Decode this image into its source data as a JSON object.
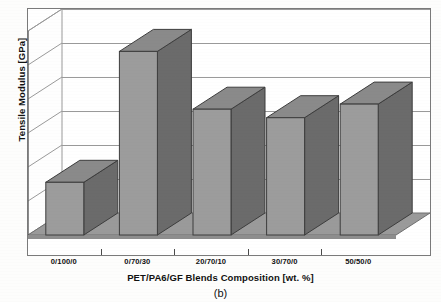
{
  "chart_data": {
    "type": "bar",
    "title": "",
    "caption": "(b)",
    "xlabel": "PET/PA6/GF Blends Composition [wt. %]",
    "ylabel": "Tensile Modulus [GPa]",
    "categories": [
      "0/100/0",
      "0/70/30",
      "20/70/10",
      "30/70/0",
      "50/50/0"
    ],
    "values": [
      1.55,
      5.4,
      3.7,
      3.45,
      3.85
    ],
    "series": [
      {
        "name": "Tensile Modulus",
        "values": [
          1.55,
          5.4,
          3.7,
          3.45,
          3.85
        ]
      }
    ],
    "ylim": [
      0,
      6
    ],
    "yticks": [
      "0",
      "1",
      "2",
      "3",
      "4",
      "5",
      "6"
    ],
    "ytick_values": [
      0,
      1,
      2,
      3,
      4,
      5,
      6
    ],
    "grid": true,
    "legend": "none",
    "style": "3d-column",
    "colors": {
      "bar_front": "#9c9c9c",
      "bar_side": "#6b6b6b",
      "bar_top": "#8a8a8a",
      "floor": "#9a9a9a",
      "wall": "#ffffff",
      "gridline": "#9a9a9a",
      "axis": "#4a4a4a",
      "text": "#111111",
      "background": "#fdfdfc"
    }
  }
}
